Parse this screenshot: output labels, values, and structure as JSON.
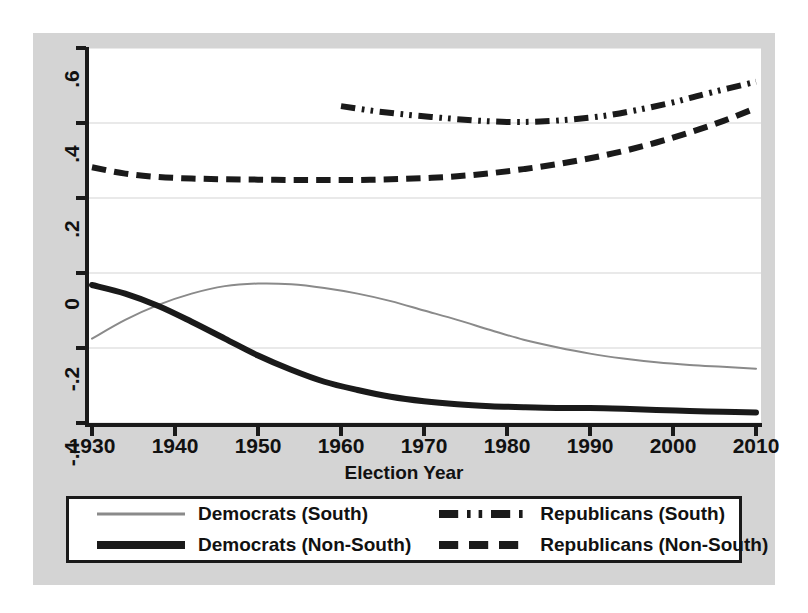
{
  "chart_data": {
    "type": "line",
    "title": "",
    "xlabel": "Election Year",
    "ylabel": "",
    "xlim": [
      1930,
      2010
    ],
    "ylim": [
      -0.4,
      0.6
    ],
    "xticks": [
      1930,
      1940,
      1950,
      1960,
      1970,
      1980,
      1990,
      2000,
      2010
    ],
    "xticklabels": [
      "1930",
      "1940",
      "1950",
      "1960",
      "1970",
      "1980",
      "1990",
      "2000",
      "2010"
    ],
    "yticks": [
      -0.4,
      -0.2,
      0,
      0.2,
      0.4,
      0.6
    ],
    "yticklabels": [
      "-.4",
      "-.2",
      "0",
      ".2",
      ".4",
      ".6"
    ],
    "grid": true,
    "grid_axis": "y",
    "legend_position": "below-plot",
    "series": [
      {
        "name": "Democrats (South)",
        "style": "solid",
        "color": "#8a8a8a",
        "width": 2,
        "x": [
          1930,
          1934,
          1938,
          1942,
          1946,
          1950,
          1954,
          1958,
          1962,
          1966,
          1970,
          1974,
          1978,
          1982,
          1986,
          1990,
          1994,
          1998,
          2002,
          2006,
          2010
        ],
        "values": [
          -0.175,
          -0.125,
          -0.085,
          -0.055,
          -0.035,
          -0.028,
          -0.03,
          -0.04,
          -0.055,
          -0.075,
          -0.1,
          -0.125,
          -0.152,
          -0.178,
          -0.198,
          -0.215,
          -0.228,
          -0.238,
          -0.245,
          -0.25,
          -0.255
        ]
      },
      {
        "name": "Democrats (Non-South)",
        "style": "solid",
        "color": "#1a1a1a",
        "width": 6,
        "x": [
          1930,
          1934,
          1938,
          1942,
          1946,
          1950,
          1954,
          1958,
          1962,
          1966,
          1970,
          1974,
          1978,
          1982,
          1986,
          1990,
          1994,
          1998,
          2002,
          2006,
          2010
        ],
        "values": [
          -0.032,
          -0.055,
          -0.088,
          -0.13,
          -0.175,
          -0.22,
          -0.258,
          -0.29,
          -0.312,
          -0.33,
          -0.342,
          -0.35,
          -0.355,
          -0.358,
          -0.36,
          -0.36,
          -0.362,
          -0.365,
          -0.368,
          -0.37,
          -0.372
        ]
      },
      {
        "name": "Republicans (South)",
        "style": "dash-dot-dot",
        "color": "#1a1a1a",
        "width": 6,
        "x": [
          1960,
          1964,
          1968,
          1972,
          1976,
          1980,
          1984,
          1988,
          1992,
          1996,
          2000,
          2004,
          2010
        ],
        "values": [
          0.445,
          0.432,
          0.422,
          0.414,
          0.407,
          0.403,
          0.404,
          0.41,
          0.42,
          0.436,
          0.455,
          0.478,
          0.51
        ]
      },
      {
        "name": "Republicans (Non-South)",
        "style": "dashed",
        "color": "#1a1a1a",
        "width": 6,
        "x": [
          1930,
          1934,
          1938,
          1942,
          1946,
          1950,
          1954,
          1958,
          1962,
          1966,
          1970,
          1974,
          1978,
          1982,
          1986,
          1990,
          1994,
          1998,
          2002,
          2006,
          2010
        ],
        "values": [
          0.282,
          0.265,
          0.256,
          0.252,
          0.25,
          0.249,
          0.248,
          0.248,
          0.248,
          0.25,
          0.253,
          0.258,
          0.266,
          0.277,
          0.29,
          0.306,
          0.325,
          0.348,
          0.375,
          0.405,
          0.44
        ]
      }
    ]
  },
  "axes": {
    "x_title": "Election Year"
  },
  "legend": {
    "items": [
      {
        "label": "Democrats (South)",
        "style": "solid-thin-gray"
      },
      {
        "label": "Republicans (South)",
        "style": "dash-dot-dot"
      },
      {
        "label": "Democrats (Non-South)",
        "style": "solid-thick-black"
      },
      {
        "label": "Republicans (Non-South)",
        "style": "dashed"
      }
    ]
  },
  "colors": {
    "figure_background": "#d4d4d4",
    "plot_background": "#ffffff",
    "axis": "#1a1a1a",
    "grid": "#e2e2e2",
    "series_gray": "#8a8a8a",
    "series_black": "#1a1a1a"
  }
}
